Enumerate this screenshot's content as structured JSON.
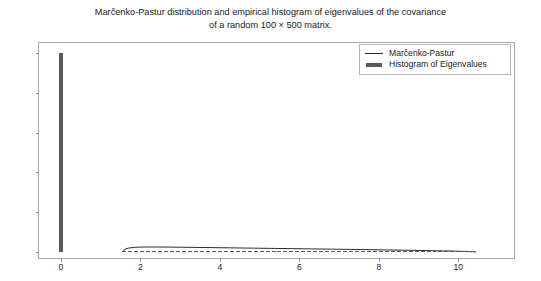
{
  "chart_data": {
    "type": "line",
    "title": "Marčenko-Pastur distribution and empirical histogram of eigenvalues of the covariance\nof a random 100 × 500 matrix.",
    "xlabel": "",
    "ylabel": "",
    "xlim": [
      -0.55,
      11.4
    ],
    "ylim": [
      -0.03,
      1.05
    ],
    "xticks": [
      0,
      2,
      4,
      6,
      8,
      10
    ],
    "xtick_labels": [
      "0",
      "2",
      "4",
      "6",
      "8",
      "10"
    ],
    "yticks": [
      0.0,
      0.2,
      0.4,
      0.6,
      0.8,
      1.0
    ],
    "ytick_labels": [
      "0.0",
      "0.2",
      "0.4",
      "0.6",
      "0.8",
      "1.0"
    ],
    "grid": false,
    "legend_position": "upper right",
    "legend": [
      "Marčenko-Pastur",
      "Histogram of Eigenvalues"
    ],
    "colors": {
      "line": "#2b2b2b",
      "bars": "#595959",
      "frame": "#a8a8a8",
      "text": "#1a1a1a"
    },
    "series": [
      {
        "name": "Marčenko-Pastur",
        "type": "line",
        "x": [
          1.55,
          1.62,
          1.72,
          1.85,
          2.0,
          2.2,
          2.45,
          2.7,
          3.0,
          3.4,
          3.8,
          4.3,
          4.8,
          5.3,
          5.8,
          6.3,
          6.8,
          7.3,
          7.8,
          8.2,
          8.6,
          9.0,
          9.3,
          9.6,
          9.9,
          10.1,
          10.25,
          10.35,
          10.42,
          10.45
        ],
        "y": [
          0.0,
          0.0155,
          0.0205,
          0.0235,
          0.0248,
          0.0253,
          0.0252,
          0.0248,
          0.0242,
          0.0232,
          0.0222,
          0.0209,
          0.0196,
          0.0183,
          0.017,
          0.0157,
          0.0144,
          0.0131,
          0.0117,
          0.0105,
          0.0093,
          0.008,
          0.0069,
          0.0058,
          0.0044,
          0.0034,
          0.0024,
          0.0015,
          0.0006,
          0.0
        ]
      },
      {
        "name": "Histogram of Eigenvalues",
        "type": "bar",
        "bar_width": 0.1,
        "x": [
          0.0,
          1.6,
          1.75,
          1.9,
          2.05,
          2.2,
          2.35,
          2.5,
          2.65,
          2.8,
          2.95,
          3.1,
          3.25,
          3.4,
          3.55,
          3.7,
          3.85,
          4.0,
          4.15,
          4.3,
          4.45,
          4.6,
          4.75,
          4.9,
          5.05,
          5.2,
          5.35,
          5.5,
          5.65,
          5.8,
          5.95,
          6.1,
          6.25,
          6.4,
          6.55,
          6.7,
          6.85,
          7.0,
          7.15,
          7.3,
          7.45,
          7.6,
          7.75,
          7.9,
          8.05,
          8.2,
          8.35,
          8.5,
          8.65,
          8.8,
          8.95,
          9.1,
          9.25,
          9.4,
          9.55,
          9.7,
          9.85,
          10.0,
          10.15,
          10.3
        ],
        "y": [
          1.0,
          0.004,
          0.006,
          0.005,
          0.006,
          0.005,
          0.006,
          0.004,
          0.005,
          0.006,
          0.004,
          0.005,
          0.004,
          0.005,
          0.006,
          0.004,
          0.005,
          0.004,
          0.005,
          0.004,
          0.005,
          0.004,
          0.004,
          0.005,
          0.004,
          0.004,
          0.005,
          0.004,
          0.004,
          0.004,
          0.005,
          0.004,
          0.004,
          0.003,
          0.004,
          0.004,
          0.003,
          0.004,
          0.003,
          0.004,
          0.003,
          0.003,
          0.004,
          0.003,
          0.003,
          0.003,
          0.003,
          0.002,
          0.003,
          0.003,
          0.002,
          0.003,
          0.002,
          0.002,
          0.002,
          0.002,
          0.002,
          0.002,
          0.001,
          0.001
        ]
      }
    ]
  }
}
